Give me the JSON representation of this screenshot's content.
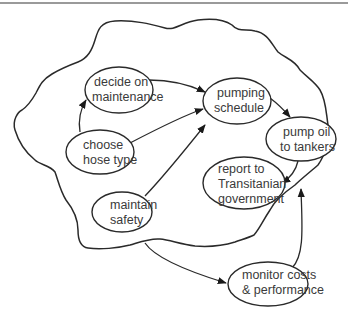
{
  "diagram": {
    "type": "concept-map",
    "top_rule_color": "#9a9a9a",
    "stroke_color": "#2a2a2a",
    "text_color": "#3a3a3a",
    "boundary": {
      "description": "wavy system boundary enclosing activities"
    },
    "nodes": [
      {
        "id": "decide_maintenance",
        "lines": [
          "decide on",
          "maintenance"
        ]
      },
      {
        "id": "pumping_schedule",
        "lines": [
          "pumping",
          "schedule"
        ]
      },
      {
        "id": "choose_hose",
        "lines": [
          "choose",
          "hose type"
        ]
      },
      {
        "id": "pump_oil",
        "lines": [
          "pump oil",
          "to tankers"
        ]
      },
      {
        "id": "report",
        "lines": [
          "report to",
          "Transitanian",
          "government"
        ]
      },
      {
        "id": "maintain_safety",
        "lines": [
          "maintain",
          "safety"
        ]
      },
      {
        "id": "monitor",
        "lines": [
          "monitor costs",
          "& performance"
        ]
      }
    ],
    "edges": [
      {
        "from": "choose_hose",
        "to": "decide_maintenance"
      },
      {
        "from": "choose_hose",
        "to": "pumping_schedule"
      },
      {
        "from": "decide_maintenance",
        "to": "pumping_schedule"
      },
      {
        "from": "maintain_safety",
        "to": "pumping_schedule"
      },
      {
        "from": "pumping_schedule",
        "to": "pump_oil"
      },
      {
        "from": "pump_oil",
        "to": "report"
      },
      {
        "from": "boundary",
        "to": "monitor"
      },
      {
        "from": "monitor",
        "to": "boundary"
      }
    ]
  }
}
